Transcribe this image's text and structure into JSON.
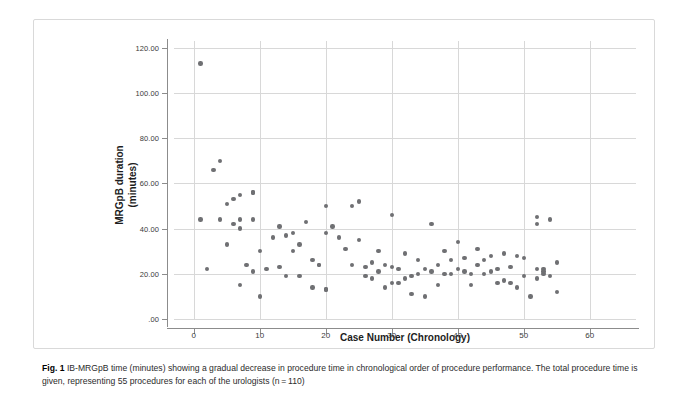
{
  "figure": {
    "label": "Fig. 1",
    "caption": "IB-MRGpB time (minutes) showing a gradual decrease in procedure time in chronological order of procedure performance. The total procedure time is given, representing 55 procedures for each of the urologists (n = 110)"
  },
  "chart_data": {
    "type": "scatter",
    "title": "",
    "xlabel": "Case Number (Chronology)",
    "ylabel": "MRGpB duration (minutes)",
    "ylabel_line1": "MRGpB duration",
    "ylabel_line2": "(minutes)",
    "xlim": [
      -3,
      67
    ],
    "ylim": [
      0,
      123
    ],
    "xticks": [
      0,
      10,
      20,
      30,
      40,
      50,
      60
    ],
    "xtick_labels": [
      "0",
      "10",
      "20",
      "30",
      "40",
      "50",
      "60"
    ],
    "yticks": [
      0,
      20,
      40,
      60,
      80,
      100,
      120
    ],
    "ytick_labels": [
      ".00",
      "20.00",
      "40.00",
      "60.00",
      "80.00",
      "100.00",
      "120.00"
    ],
    "grid": true,
    "grid_color": "#d8d8d8",
    "marker_color": "#6f7073",
    "marker_size": 4.4,
    "legend": null,
    "n_points": 110,
    "points": [
      [
        1,
        113
      ],
      [
        1,
        44
      ],
      [
        2,
        22
      ],
      [
        3,
        66
      ],
      [
        4,
        70
      ],
      [
        4,
        44
      ],
      [
        5,
        51
      ],
      [
        5,
        33
      ],
      [
        6,
        53
      ],
      [
        6,
        42
      ],
      [
        7,
        55
      ],
      [
        7,
        44
      ],
      [
        7,
        40
      ],
      [
        7,
        15
      ],
      [
        8,
        24
      ],
      [
        9,
        56
      ],
      [
        9,
        56
      ],
      [
        9,
        44
      ],
      [
        9,
        21
      ],
      [
        10,
        30
      ],
      [
        10,
        10
      ],
      [
        11,
        22
      ],
      [
        12,
        36
      ],
      [
        13,
        41
      ],
      [
        13,
        23
      ],
      [
        14,
        37
      ],
      [
        14,
        19
      ],
      [
        15,
        38
      ],
      [
        15,
        30
      ],
      [
        16,
        33
      ],
      [
        16,
        19
      ],
      [
        17,
        43
      ],
      [
        18,
        26
      ],
      [
        18,
        14
      ],
      [
        19,
        24
      ],
      [
        19,
        24
      ],
      [
        20,
        50
      ],
      [
        20,
        38
      ],
      [
        20,
        13
      ],
      [
        20,
        13
      ],
      [
        21,
        41
      ],
      [
        22,
        36
      ],
      [
        23,
        31
      ],
      [
        24,
        50
      ],
      [
        24,
        24
      ],
      [
        25,
        52
      ],
      [
        25,
        35
      ],
      [
        26,
        23
      ],
      [
        26,
        19
      ],
      [
        27,
        25
      ],
      [
        27,
        18
      ],
      [
        28,
        30
      ],
      [
        28,
        21
      ],
      [
        29,
        24
      ],
      [
        29,
        14
      ],
      [
        30,
        46
      ],
      [
        30,
        23
      ],
      [
        30,
        16
      ],
      [
        31,
        22
      ],
      [
        31,
        16
      ],
      [
        32,
        29
      ],
      [
        32,
        18
      ],
      [
        33,
        19
      ],
      [
        33,
        11
      ],
      [
        34,
        26
      ],
      [
        34,
        20
      ],
      [
        35,
        22
      ],
      [
        35,
        10
      ],
      [
        36,
        42
      ],
      [
        36,
        21
      ],
      [
        37,
        24
      ],
      [
        37,
        15
      ],
      [
        38,
        30
      ],
      [
        38,
        20
      ],
      [
        39,
        26
      ],
      [
        39,
        20
      ],
      [
        40,
        34
      ],
      [
        40,
        22
      ],
      [
        41,
        27
      ],
      [
        41,
        21
      ],
      [
        42,
        20
      ],
      [
        42,
        15
      ],
      [
        43,
        31
      ],
      [
        43,
        24
      ],
      [
        44,
        26
      ],
      [
        44,
        20
      ],
      [
        45,
        28
      ],
      [
        45,
        21
      ],
      [
        46,
        22
      ],
      [
        46,
        16
      ],
      [
        47,
        29
      ],
      [
        47,
        17
      ],
      [
        48,
        23
      ],
      [
        48,
        16
      ],
      [
        49,
        28
      ],
      [
        49,
        14
      ],
      [
        50,
        27
      ],
      [
        50,
        19
      ],
      [
        51,
        10
      ],
      [
        52,
        45
      ],
      [
        52,
        42
      ],
      [
        52,
        22
      ],
      [
        52,
        18
      ],
      [
        53,
        22
      ],
      [
        53,
        21
      ],
      [
        53,
        20
      ],
      [
        54,
        44
      ],
      [
        54,
        19
      ],
      [
        55,
        25
      ],
      [
        55,
        12
      ]
    ]
  }
}
